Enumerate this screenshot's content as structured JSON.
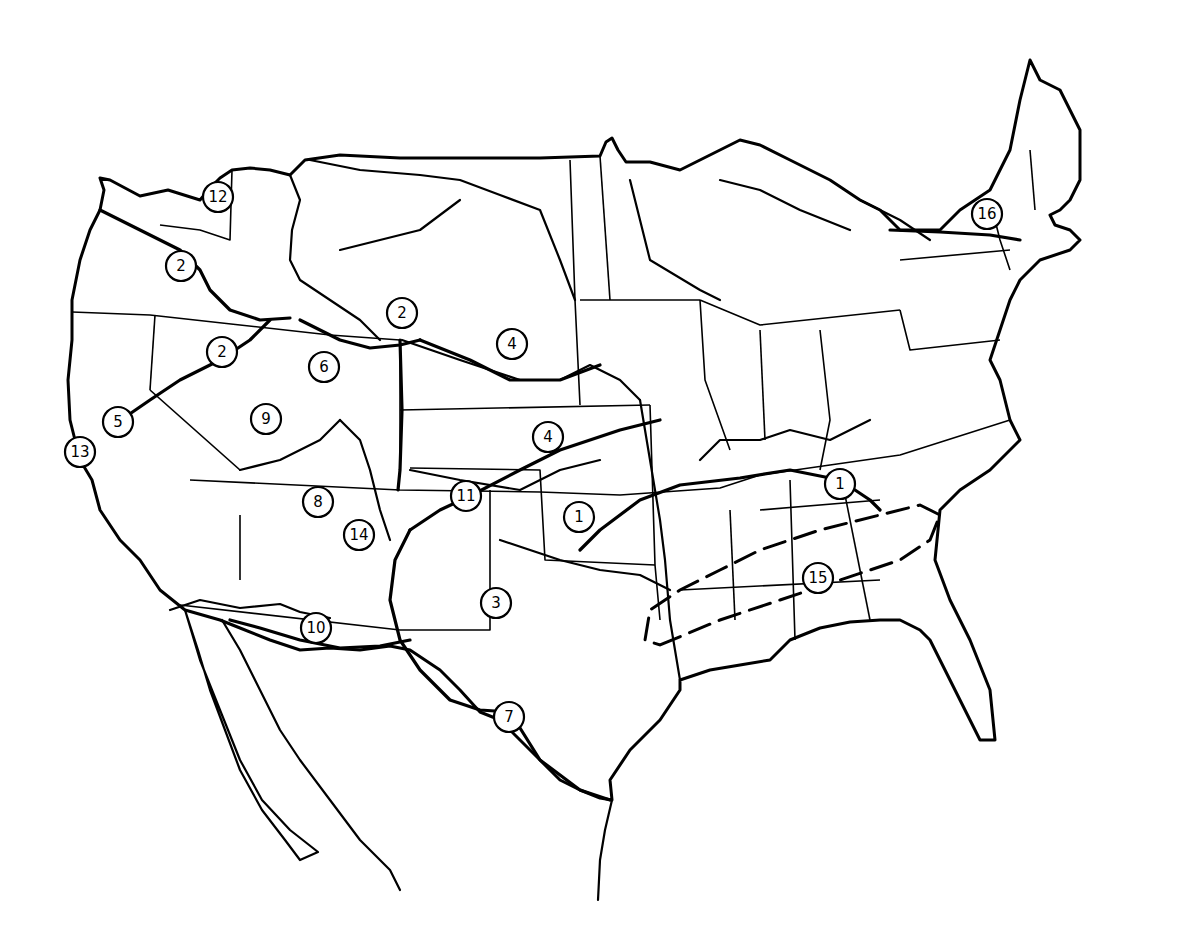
{
  "map": {
    "type": "line-drawing map of the contiguous United States with numbered regions",
    "colors": {
      "ink": "#000000",
      "background": "#ffffff"
    },
    "labels": [
      {
        "id": "12",
        "x": 218,
        "y": 197
      },
      {
        "id": "2",
        "x": 181,
        "y": 266
      },
      {
        "id": "2",
        "x": 402,
        "y": 313
      },
      {
        "id": "2",
        "x": 222,
        "y": 352
      },
      {
        "id": "4",
        "x": 512,
        "y": 344
      },
      {
        "id": "6",
        "x": 324,
        "y": 367
      },
      {
        "id": "5",
        "x": 118,
        "y": 422
      },
      {
        "id": "9",
        "x": 266,
        "y": 419
      },
      {
        "id": "4",
        "x": 548,
        "y": 437
      },
      {
        "id": "13",
        "x": 80,
        "y": 452
      },
      {
        "id": "1",
        "x": 840,
        "y": 484
      },
      {
        "id": "11",
        "x": 466,
        "y": 496
      },
      {
        "id": "8",
        "x": 318,
        "y": 502
      },
      {
        "id": "1",
        "x": 579,
        "y": 517
      },
      {
        "id": "14",
        "x": 359,
        "y": 535
      },
      {
        "id": "15",
        "x": 818,
        "y": 578
      },
      {
        "id": "3",
        "x": 496,
        "y": 603
      },
      {
        "id": "10",
        "x": 316,
        "y": 628
      },
      {
        "id": "7",
        "x": 509,
        "y": 717
      },
      {
        "id": "16",
        "x": 987,
        "y": 214
      }
    ]
  }
}
